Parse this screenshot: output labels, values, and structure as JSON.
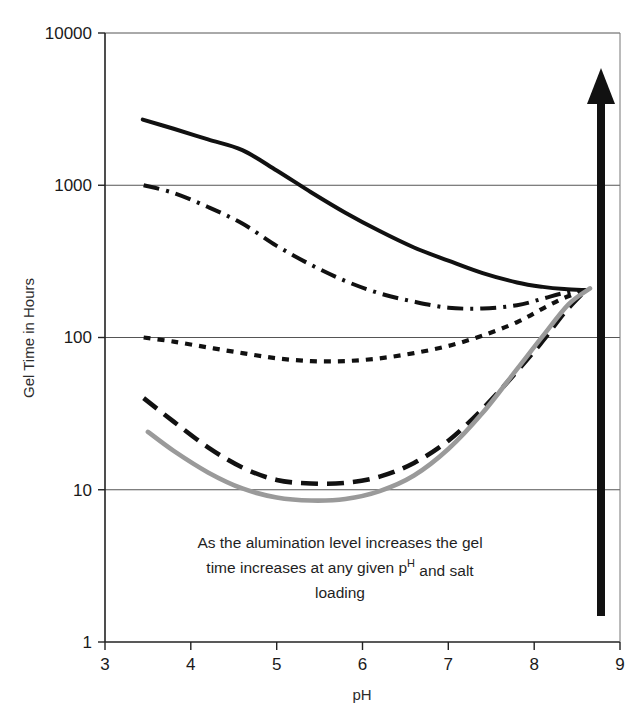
{
  "chart_data": {
    "type": "line",
    "title": "",
    "xlabel": "pH",
    "ylabel": "Gel Time in Hours",
    "xlim": [
      3,
      9
    ],
    "ylim": [
      1,
      10000
    ],
    "yscale": "log",
    "grid": true,
    "legend": "none",
    "x_ticks": [
      "3",
      "4",
      "5",
      "6",
      "7",
      "8",
      "9"
    ],
    "y_ticks": [
      "10000",
      "1000",
      "100",
      "10",
      "1"
    ],
    "annotations": [
      {
        "name": "alumination-note",
        "line1": "As the alumination level increases the gel",
        "line2_pre": "time increases at any given p",
        "line2_sup": "H",
        "line2_post": " and salt",
        "line3": "loading"
      },
      {
        "name": "increasing-alumination-arrow",
        "kind": "arrow",
        "direction": "up",
        "x": 8.55,
        "y_from": 1.6,
        "y_to": 6500
      }
    ],
    "series": [
      {
        "name": "alumination-level-5-highest",
        "style": "solid",
        "color": "#111111",
        "width": 4.0,
        "x": [
          3.44,
          3.8,
          4.2,
          4.6,
          5.0,
          5.4,
          5.8,
          6.2,
          6.6,
          7.0,
          7.4,
          7.8,
          8.1,
          8.35,
          8.6
        ],
        "y": [
          2700,
          2350,
          2000,
          1700,
          1250,
          900,
          660,
          500,
          390,
          320,
          265,
          230,
          215,
          208,
          205
        ]
      },
      {
        "name": "alumination-level-4",
        "style": "dash-dot",
        "color": "#111111",
        "width": 4.0,
        "x": [
          3.45,
          3.8,
          4.2,
          4.6,
          5.0,
          5.4,
          5.8,
          6.2,
          6.6,
          7.0,
          7.4,
          7.8,
          8.1,
          8.35,
          8.6
        ],
        "y": [
          1000,
          890,
          720,
          560,
          400,
          300,
          235,
          195,
          172,
          157,
          155,
          163,
          180,
          196,
          205
        ]
      },
      {
        "name": "alumination-level-3",
        "style": "dotted",
        "color": "#111111",
        "width": 4.2,
        "x": [
          3.45,
          3.8,
          4.2,
          4.6,
          5.0,
          5.4,
          5.8,
          6.2,
          6.6,
          7.0,
          7.4,
          7.8,
          8.1,
          8.35,
          8.6
        ],
        "y": [
          100,
          94,
          86,
          79,
          73,
          70,
          70,
          73,
          79,
          88,
          103,
          126,
          155,
          182,
          205
        ]
      },
      {
        "name": "alumination-level-2",
        "style": "long-dash",
        "color": "#111111",
        "width": 4.6,
        "x": [
          3.45,
          3.8,
          4.2,
          4.6,
          5.0,
          5.4,
          5.8,
          6.2,
          6.6,
          7.0,
          7.4,
          7.8,
          8.1,
          8.35,
          8.6
        ],
        "y": [
          40,
          28,
          19,
          14,
          11.6,
          11.0,
          11.1,
          12.2,
          15.0,
          21.0,
          34.0,
          60.0,
          95.0,
          145.0,
          205
        ]
      },
      {
        "name": "alumination-level-1-lowest",
        "style": "solid",
        "color": "#9a9a9a",
        "width": 4.6,
        "x": [
          3.5,
          3.8,
          4.2,
          4.6,
          5.0,
          5.4,
          5.8,
          6.2,
          6.6,
          7.0,
          7.4,
          7.8,
          8.1,
          8.4,
          8.65
        ],
        "y": [
          24,
          18,
          13,
          10.2,
          8.9,
          8.5,
          8.7,
          9.8,
          12.4,
          18.5,
          32.0,
          62.0,
          102.0,
          165.0,
          210
        ]
      }
    ]
  },
  "colors": {
    "axis": "#222222",
    "grid": "#555555",
    "series_black": "#111111",
    "series_gray": "#9a9a9a",
    "arrow": "#111111"
  }
}
